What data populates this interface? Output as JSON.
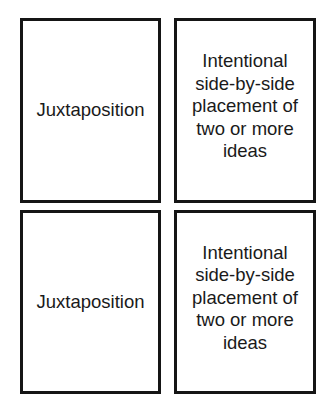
{
  "cards": [
    {
      "term": "Juxtaposition",
      "definition": "Intentional\nside-by-side\nplacement of\ntwo or more\nideas"
    },
    {
      "term": "Juxtaposition",
      "definition": "Intentional\nside-by-side\nplacement of\ntwo or more\nideas"
    }
  ],
  "colors": {
    "border": "#151515",
    "text": "#1a1a1a",
    "background": "#ffffff"
  }
}
